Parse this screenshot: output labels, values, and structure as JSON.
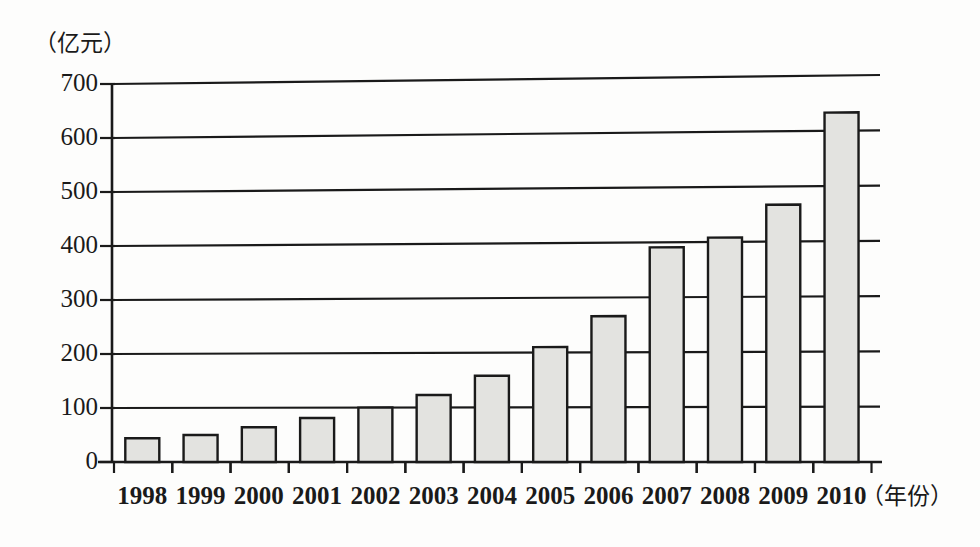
{
  "chart_data": {
    "type": "bar",
    "title": "",
    "subtitle": "",
    "xlabel": "（年份）",
    "ylabel": "（亿元）",
    "categories": [
      "1998",
      "1999",
      "2000",
      "2001",
      "2002",
      "2003",
      "2004",
      "2005",
      "2006",
      "2007",
      "2008",
      "2009",
      "2010"
    ],
    "values": [
      44,
      50,
      64,
      81,
      100,
      123,
      158,
      210,
      266,
      391,
      408,
      467,
      633
    ],
    "series": [
      {
        "name": "",
        "values": [
          44,
          50,
          64,
          81,
          100,
          123,
          158,
          210,
          266,
          391,
          408,
          467,
          633
        ]
      }
    ],
    "ylim": [
      0,
      700
    ],
    "yticks": [
      0,
      100,
      200,
      300,
      400,
      500,
      600,
      700
    ],
    "ytick_labels": [
      "0",
      "100",
      "200",
      "300",
      "400",
      "500",
      "600",
      "700"
    ],
    "grid": true,
    "grid_axis": "y",
    "legend": false,
    "legend_position": "none",
    "bar_fill_color": "#e3e3e0",
    "bar_edge_color": "#1a1a1a",
    "axis_color": "#1a1a1a",
    "background_color": "#fdfdfc",
    "annotations": []
  }
}
